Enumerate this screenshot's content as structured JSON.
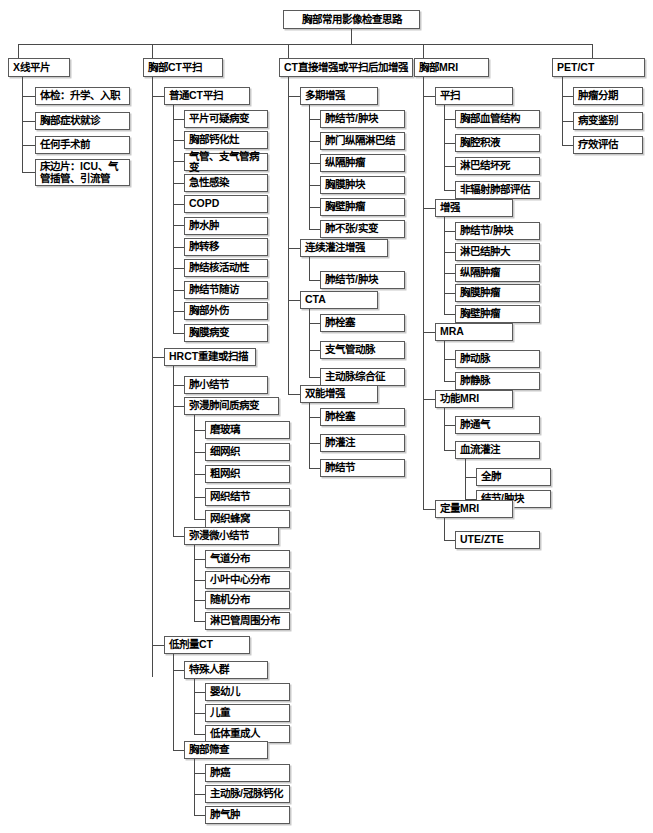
{
  "diagram": {
    "type": "tree-flowchart",
    "title": "胸部常用影像检查思路",
    "root": {
      "label": "胸部常用影像检查思路"
    },
    "branches": [
      {
        "label": "X线平片",
        "children": [
          {
            "label": "体检：升学、入职"
          },
          {
            "label": "胸部症状就诊"
          },
          {
            "label": "任何手术前"
          },
          {
            "label": "床边片：ICU、气\n管插管、引流管"
          }
        ]
      },
      {
        "label": "胸部CT平扫",
        "children": [
          {
            "label": "普通CT平扫",
            "children": [
              {
                "label": "平片可疑病变"
              },
              {
                "label": "胸部钙化灶"
              },
              {
                "label": "气管、支气管病变"
              },
              {
                "label": "急性感染"
              },
              {
                "label": "COPD"
              },
              {
                "label": "肺水肿"
              },
              {
                "label": "肺转移"
              },
              {
                "label": "肺结核活动性"
              },
              {
                "label": "肺结节随访"
              },
              {
                "label": "胸部外伤"
              },
              {
                "label": "胸膜病变"
              }
            ]
          },
          {
            "label": "HRCT重建或扫描",
            "children": [
              {
                "label": "肺小结节"
              },
              {
                "label": "弥漫肺间质病变",
                "children": [
                  {
                    "label": "磨玻璃"
                  },
                  {
                    "label": "细网织"
                  },
                  {
                    "label": "粗网织"
                  },
                  {
                    "label": "网织结节"
                  },
                  {
                    "label": "网织蜂窝"
                  }
                ]
              },
              {
                "label": "弥漫微小结节",
                "children": [
                  {
                    "label": "气道分布"
                  },
                  {
                    "label": "小叶中心分布"
                  },
                  {
                    "label": "随机分布"
                  },
                  {
                    "label": "淋巴管周围分布"
                  }
                ]
              }
            ]
          },
          {
            "label": "低剂量CT",
            "children": [
              {
                "label": "特殊人群",
                "children": [
                  {
                    "label": "婴幼儿"
                  },
                  {
                    "label": "儿童"
                  },
                  {
                    "label": "低体重成人"
                  }
                ]
              },
              {
                "label": "胸部筛查",
                "children": [
                  {
                    "label": "肺癌"
                  },
                  {
                    "label": "主动脉/冠脉钙化"
                  },
                  {
                    "label": "肺气肿"
                  }
                ]
              }
            ]
          }
        ]
      },
      {
        "label": "CT直接增强或平扫后加增强",
        "children": [
          {
            "label": "多期增强",
            "children": [
              {
                "label": "肺结节/肿块"
              },
              {
                "label": "肺门纵隔淋巴结"
              },
              {
                "label": "纵隔肿瘤"
              },
              {
                "label": "胸膜肿块"
              },
              {
                "label": "胸壁肿瘤"
              },
              {
                "label": "肺不张/实变"
              }
            ]
          },
          {
            "label": "连续灌注增强",
            "children": [
              {
                "label": "肺结节/肿块"
              }
            ]
          },
          {
            "label": "CTA",
            "children": [
              {
                "label": "肺栓塞"
              },
              {
                "label": "支气管动脉"
              },
              {
                "label": "主动脉综合征"
              }
            ]
          },
          {
            "label": "双能增强",
            "children": [
              {
                "label": "肺栓塞"
              },
              {
                "label": "肺灌注"
              },
              {
                "label": "肺结节"
              }
            ]
          }
        ]
      },
      {
        "label": "胸部MRI",
        "children": [
          {
            "label": "平扫",
            "children": [
              {
                "label": "胸部血管结构"
              },
              {
                "label": "胸腔积液"
              },
              {
                "label": "淋巴结坏死"
              },
              {
                "label": "非辐射肺部评估"
              }
            ]
          },
          {
            "label": "增强",
            "children": [
              {
                "label": "肺结节/肿块"
              },
              {
                "label": "淋巴结肿大"
              },
              {
                "label": "纵隔肿瘤"
              },
              {
                "label": "胸膜肿瘤"
              },
              {
                "label": "胸壁肿瘤"
              }
            ]
          },
          {
            "label": "MRA",
            "children": [
              {
                "label": "肺动脉"
              },
              {
                "label": "肺静脉"
              }
            ]
          },
          {
            "label": "功能MRI",
            "children": [
              {
                "label": "肺通气"
              },
              {
                "label": "血流灌注",
                "children": [
                  {
                    "label": "全肺"
                  },
                  {
                    "label": "结节/肿块"
                  }
                ]
              }
            ]
          },
          {
            "label": "定量MRI",
            "children": [
              {
                "label": "UTE/ZTE"
              }
            ]
          }
        ]
      },
      {
        "label": "PET/CT",
        "children": [
          {
            "label": "肿瘤分期"
          },
          {
            "label": "病变鉴别"
          },
          {
            "label": "疗效评估"
          }
        ]
      }
    ]
  },
  "nodes": {
    "root": "胸部常用影像检查思路",
    "c1_head": "X线平片",
    "c1_1": "体检：升学、入职",
    "c1_2": "胸部症状就诊",
    "c1_3": "任何手术前",
    "c1_4": "床边片：ICU、气\n管插管、引流管",
    "c2_head": "胸部CT平扫",
    "c2_a": "普通CT平扫",
    "c2_a1": "平片可疑病变",
    "c2_a2": "胸部钙化灶",
    "c2_a3": "气管、支气管病变",
    "c2_a4": "急性感染",
    "c2_a5": "COPD",
    "c2_a6": "肺水肿",
    "c2_a7": "肺转移",
    "c2_a8": "肺结核活动性",
    "c2_a9": "肺结节随访",
    "c2_a10": "胸部外伤",
    "c2_a11": "胸膜病变",
    "c2_b": "HRCT重建或扫描",
    "c2_b1": "肺小结节",
    "c2_b2": "弥漫肺间质病变",
    "c2_b2_1": "磨玻璃",
    "c2_b2_2": "细网织",
    "c2_b2_3": "粗网织",
    "c2_b2_4": "网织结节",
    "c2_b2_5": "网织蜂窝",
    "c2_b3": "弥漫微小结节",
    "c2_b3_1": "气道分布",
    "c2_b3_2": "小叶中心分布",
    "c2_b3_3": "随机分布",
    "c2_b3_4": "淋巴管周围分布",
    "c2_c": "低剂量CT",
    "c2_c1": "特殊人群",
    "c2_c1_1": "婴幼儿",
    "c2_c1_2": "儿童",
    "c2_c1_3": "低体重成人",
    "c2_c2": "胸部筛查",
    "c2_c2_1": "肺癌",
    "c2_c2_2": "主动脉/冠脉钙化",
    "c2_c2_3": "肺气肿",
    "c3_head": "CT直接增强或平扫后加增强",
    "c3_a": "多期增强",
    "c3_a1": "肺结节/肿块",
    "c3_a2": "肺门纵隔淋巴结",
    "c3_a3": "纵隔肿瘤",
    "c3_a4": "胸膜肿块",
    "c3_a5": "胸壁肿瘤",
    "c3_a6": "肺不张/实变",
    "c3_b": "连续灌注增强",
    "c3_b1": "肺结节/肿块",
    "c3_c": "CTA",
    "c3_c1": "肺栓塞",
    "c3_c2": "支气管动脉",
    "c3_c3": "主动脉综合征",
    "c3_d": "双能增强",
    "c3_d1": "肺栓塞",
    "c3_d2": "肺灌注",
    "c3_d3": "肺结节",
    "c4_head": "胸部MRI",
    "c4_a": "平扫",
    "c4_a1": "胸部血管结构",
    "c4_a2": "胸腔积液",
    "c4_a3": "淋巴结坏死",
    "c4_a4": "非辐射肺部评估",
    "c4_b": "增强",
    "c4_b1": "肺结节/肿块",
    "c4_b2": "淋巴结肿大",
    "c4_b3": "纵隔肿瘤",
    "c4_b4": "胸膜肿瘤",
    "c4_b5": "胸壁肿瘤",
    "c4_c": "MRA",
    "c4_c1": "肺动脉",
    "c4_c2": "肺静脉",
    "c4_d": "功能MRI",
    "c4_d1": "肺通气",
    "c4_d2": "血流灌注",
    "c4_d2_1": "全肺",
    "c4_d2_2": "结节/肿块",
    "c4_e": "定量MRI",
    "c4_e1": "UTE/ZTE",
    "c5_head": "PET/CT",
    "c5_1": "肿瘤分期",
    "c5_2": "病变鉴别",
    "c5_3": "疗效评估"
  },
  "style": {
    "box_border": "#5a5a5a",
    "box_shadow": "#c9c9c9",
    "line": "#4a4a4a",
    "background": "#ffffff"
  }
}
